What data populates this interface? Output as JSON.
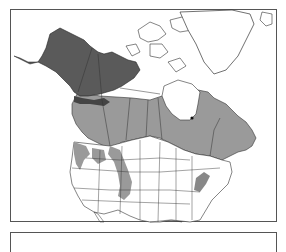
{
  "map": {
    "type": "range-map",
    "region": "North America",
    "colors": {
      "background": "#ffffff",
      "water": "#ffffff",
      "land_outline": "#333333",
      "range_dark": "#5a5a5a",
      "range_medium": "#9a9a9a",
      "frame_border": "#555555"
    },
    "legend": {
      "visible_text": ""
    }
  }
}
